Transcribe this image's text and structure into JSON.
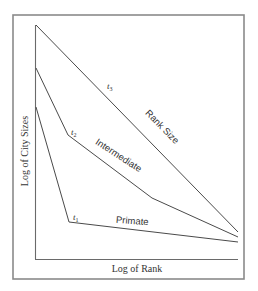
{
  "chart_data": {
    "type": "line",
    "title": "",
    "xlabel": "Log of Rank",
    "ylabel": "Log of City Sizes",
    "grid": false,
    "legend": "none (inline labels)",
    "axis_ticks": false,
    "series": [
      {
        "name": "Rank Size",
        "time_label": "t3",
        "points_px": [
          [
            36,
            25
          ],
          [
            238,
            232
          ]
        ],
        "description": "Straight line from highest on y-axis to lower right"
      },
      {
        "name": "Intermediate",
        "time_label": "t2",
        "points_px": [
          [
            36,
            68
          ],
          [
            68,
            135
          ],
          [
            152,
            198
          ],
          [
            238,
            237
          ]
        ],
        "description": "Steep drop, then moderate slope, then gentler slope"
      },
      {
        "name": "Primate",
        "time_label": "t1",
        "points_px": [
          [
            36,
            107
          ],
          [
            69,
            222
          ],
          [
            238,
            242
          ]
        ],
        "description": "Very steep drop for the primate city, then nearly flat"
      }
    ]
  },
  "labels": {
    "xlabel": "Log of Rank",
    "ylabel": "Log of City Sizes",
    "rank_size": "Rank Size",
    "intermediate": "Intermediate",
    "primate": "Primate",
    "t3_base": "t",
    "t3_sub": "3",
    "t2_base": "t",
    "t2_sub": "2",
    "t1_base": "t",
    "t1_sub": "1"
  },
  "colors": {
    "frame": "#8a8a8a",
    "axis": "#6a6a6a",
    "line": "#4a4a4a",
    "text": "#333333",
    "background": "#ffffff"
  }
}
